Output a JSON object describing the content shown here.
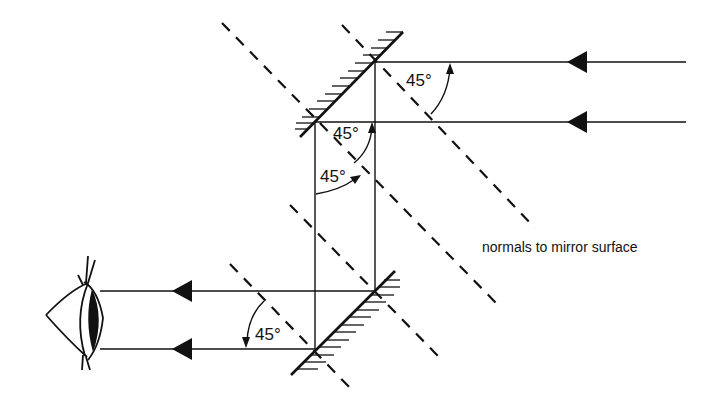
{
  "diagram": {
    "type": "periscope-ray-diagram",
    "labels": {
      "angle_top_right": "45°",
      "angle_top_mirror_upper": "45°",
      "angle_top_mirror_lower": "45°",
      "angle_bottom_mirror": "45°",
      "normals_caption": "normals to mirror surface"
    },
    "elements": {
      "mirrors": [
        "top-mirror",
        "bottom-mirror"
      ],
      "incoming_rays": 2,
      "outgoing_rays": 2,
      "observer": "eye-icon"
    },
    "colors": {
      "stroke": "#111111",
      "background": "#ffffff"
    }
  }
}
